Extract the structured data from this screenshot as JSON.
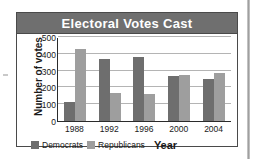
{
  "figure": {
    "title": "Electoral Votes Cast",
    "title_bar_color": "#6f6f6f",
    "frame_border_color": "#4a4a4a"
  },
  "chart_data": {
    "type": "bar",
    "title": "Electoral Votes Cast",
    "xlabel": "Year",
    "ylabel": "Number of votes",
    "categories": [
      "1988",
      "1992",
      "1996",
      "2000",
      "2004"
    ],
    "series": [
      {
        "name": "Democrats",
        "color": "#6e6e6e",
        "values": [
          111,
          370,
          379,
          266,
          251
        ]
      },
      {
        "name": "Republicans",
        "color": "#9e9e9e",
        "values": [
          426,
          168,
          159,
          271,
          286
        ]
      }
    ],
    "ylim": [
      0,
      500
    ],
    "yticks": [
      0,
      100,
      200,
      300,
      400,
      500
    ],
    "ytick_labels": [
      "0",
      "100",
      "200",
      "300",
      "400",
      "500"
    ],
    "grid": true,
    "legend_position": "bottom-left"
  }
}
